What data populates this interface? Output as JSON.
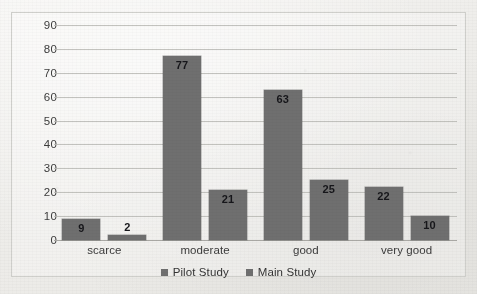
{
  "chart_data": {
    "type": "bar",
    "title": "",
    "subtitle": "",
    "xlabel": "",
    "ylabel": "",
    "categories": [
      "scarce",
      "moderate",
      "good",
      "very good"
    ],
    "series": [
      {
        "name": "Pilot Study",
        "values": [
          9,
          77,
          63,
          22
        ],
        "color": "#6f6f6f"
      },
      {
        "name": "Main Study",
        "values": [
          2,
          21,
          25,
          10
        ],
        "color": "#6f6f6f"
      }
    ],
    "ylim": [
      0,
      90
    ],
    "ytick_step": 10,
    "yticks": [
      90,
      80,
      70,
      60,
      50,
      40,
      30,
      20,
      10,
      0
    ],
    "grid": "horizontal",
    "legend_position": "bottom-center",
    "annotations": [
      "9",
      "2",
      "77",
      "21",
      "63",
      "25",
      "22",
      "10"
    ]
  },
  "colors": {
    "bar": "#6f6f6f",
    "gridline": "#b9b8b4",
    "border": "#cfcfcb",
    "text": "#3c3c3c",
    "value_label": "#16161a",
    "background": "#f2f1ef"
  }
}
